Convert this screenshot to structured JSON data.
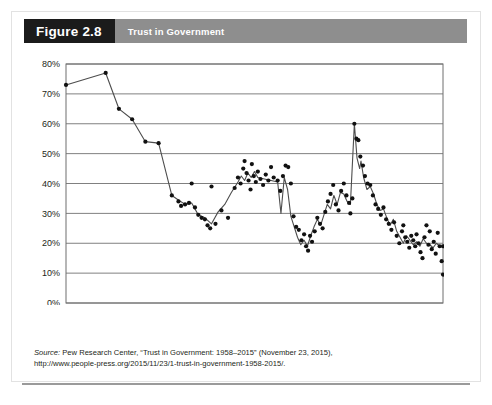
{
  "figure": {
    "badge_label": "Figure 2.8",
    "title": "Trust in Government"
  },
  "source": {
    "label": "Source:",
    "text": " Pew Research Center, “Trust in Government: 1958–2015” (November 23, 2015),",
    "url_line": "http://www.people-press.org/2015/11/23/1-trust-in-government-1958-2015/."
  },
  "colors": {
    "badge_background": "#1b1b1b",
    "title_background": "#8e8e8e",
    "gridline": "#808080",
    "plot_border": "#6f6f6f",
    "line": "#4d4d4d",
    "marker": "#111111",
    "bottom_rule": "#9a9a9a"
  },
  "chart_data": {
    "type": "line",
    "title": "Trust in Government",
    "xlabel": "",
    "ylabel": "",
    "xlim": [
      1958,
      2015
    ],
    "ylim": [
      0,
      80
    ],
    "grid": true,
    "legend": "none",
    "ytick_labels": [
      "0%",
      "10%",
      "20%",
      "30%",
      "40%",
      "50%",
      "60%",
      "70%",
      "80%"
    ],
    "ytick_values": [
      0,
      10,
      20,
      30,
      40,
      50,
      60,
      70,
      80
    ],
    "xtick_labels": [
      "1958",
      "1961",
      "1964",
      "1967",
      "1970",
      "1973",
      "1976",
      "1979",
      "1982",
      "1985",
      "1988",
      "1991",
      "1994",
      "1997",
      "2000",
      "2003",
      "2006",
      "2009",
      "2012",
      "2015"
    ],
    "xtick_values": [
      1958,
      1961,
      1964,
      1967,
      1970,
      1973,
      1976,
      1979,
      1982,
      1985,
      1988,
      1991,
      1994,
      1997,
      2000,
      2003,
      2006,
      2009,
      2012,
      2015
    ],
    "series": [
      {
        "name": "Trust in government (trend line)",
        "type": "line",
        "points": [
          [
            1958.0,
            73.0
          ],
          [
            1964.0,
            77.0
          ],
          [
            1966.0,
            65.0
          ],
          [
            1968.0,
            61.5
          ],
          [
            1970.0,
            54.0
          ],
          [
            1972.0,
            53.5
          ],
          [
            1974.0,
            36.0
          ],
          [
            1975.0,
            34.5
          ],
          [
            1976.0,
            33.0
          ],
          [
            1977.0,
            33.5
          ],
          [
            1978.0,
            29.5
          ],
          [
            1979.0,
            28.5
          ],
          [
            1980.0,
            26.5
          ],
          [
            1981.0,
            30.5
          ],
          [
            1982.0,
            33.0
          ],
          [
            1983.0,
            37.0
          ],
          [
            1984.0,
            40.5
          ],
          [
            1984.5,
            42.5
          ],
          [
            1985.0,
            41.0
          ],
          [
            1985.5,
            43.5
          ],
          [
            1986.0,
            42.0
          ],
          [
            1986.5,
            44.0
          ],
          [
            1987.0,
            42.0
          ],
          [
            1988.0,
            41.5
          ],
          [
            1989.0,
            41.0
          ],
          [
            1990.0,
            40.5
          ],
          [
            1990.5,
            30.0
          ],
          [
            1991.0,
            42.0
          ],
          [
            1991.5,
            38.0
          ],
          [
            1992.0,
            29.0
          ],
          [
            1993.0,
            22.0
          ],
          [
            1993.5,
            19.5
          ],
          [
            1994.0,
            21.0
          ],
          [
            1994.5,
            19.0
          ],
          [
            1995.0,
            22.5
          ],
          [
            1995.5,
            25.5
          ],
          [
            1996.0,
            28.0
          ],
          [
            1996.5,
            26.0
          ],
          [
            1997.0,
            29.5
          ],
          [
            1997.5,
            33.0
          ],
          [
            1998.0,
            31.5
          ],
          [
            1998.5,
            36.0
          ],
          [
            1999.0,
            33.0
          ],
          [
            1999.5,
            37.0
          ],
          [
            2000.0,
            36.5
          ],
          [
            2000.5,
            34.0
          ],
          [
            2001.0,
            33.0
          ],
          [
            2001.6,
            60.0
          ],
          [
            2002.0,
            48.5
          ],
          [
            2002.4,
            45.0
          ],
          [
            2002.6,
            47.5
          ],
          [
            2003.0,
            42.0
          ],
          [
            2003.5,
            38.0
          ],
          [
            2004.0,
            39.0
          ],
          [
            2004.5,
            36.5
          ],
          [
            2005.0,
            33.0
          ],
          [
            2005.5,
            31.0
          ],
          [
            2006.0,
            31.5
          ],
          [
            2006.5,
            28.5
          ],
          [
            2007.0,
            26.0
          ],
          [
            2007.5,
            28.0
          ],
          [
            2008.0,
            24.0
          ],
          [
            2008.5,
            22.0
          ],
          [
            2009.0,
            20.0
          ],
          [
            2009.5,
            22.5
          ],
          [
            2010.0,
            21.0
          ],
          [
            2010.5,
            19.5
          ],
          [
            2011.0,
            20.5
          ],
          [
            2011.5,
            19.0
          ],
          [
            2012.0,
            21.5
          ],
          [
            2012.5,
            20.0
          ],
          [
            2013.0,
            19.5
          ],
          [
            2013.5,
            18.5
          ],
          [
            2014.0,
            20.0
          ],
          [
            2014.5,
            19.0
          ],
          [
            2015.0,
            19.0
          ]
        ]
      },
      {
        "name": "Individual survey readings",
        "type": "scatter",
        "points": [
          [
            1958.0,
            73.0
          ],
          [
            1964.0,
            77.0
          ],
          [
            1966.0,
            65.0
          ],
          [
            1968.0,
            61.5
          ],
          [
            1970.0,
            54.0
          ],
          [
            1972.0,
            53.5
          ],
          [
            1974.0,
            36.0
          ],
          [
            1975.0,
            34.0
          ],
          [
            1975.4,
            32.5
          ],
          [
            1976.0,
            33.0
          ],
          [
            1976.6,
            33.5
          ],
          [
            1977.0,
            40.0
          ],
          [
            1977.5,
            32.0
          ],
          [
            1978.0,
            29.5
          ],
          [
            1978.5,
            28.5
          ],
          [
            1979.0,
            28.0
          ],
          [
            1979.4,
            26.0
          ],
          [
            1979.8,
            25.0
          ],
          [
            1980.0,
            39.0
          ],
          [
            1980.6,
            26.5
          ],
          [
            1981.5,
            31.0
          ],
          [
            1982.5,
            28.5
          ],
          [
            1983.5,
            38.5
          ],
          [
            1984.0,
            42.0
          ],
          [
            1984.4,
            40.0
          ],
          [
            1984.8,
            45.0
          ],
          [
            1985.0,
            47.5
          ],
          [
            1985.3,
            43.5
          ],
          [
            1985.6,
            41.0
          ],
          [
            1985.9,
            38.0
          ],
          [
            1986.1,
            46.5
          ],
          [
            1986.4,
            42.5
          ],
          [
            1986.7,
            40.5
          ],
          [
            1987.0,
            44.0
          ],
          [
            1987.4,
            41.5
          ],
          [
            1987.8,
            39.5
          ],
          [
            1988.2,
            43.0
          ],
          [
            1988.6,
            41.0
          ],
          [
            1989.0,
            45.5
          ],
          [
            1989.4,
            42.0
          ],
          [
            1990.0,
            41.0
          ],
          [
            1990.4,
            37.5
          ],
          [
            1990.8,
            42.5
          ],
          [
            1991.2,
            46.0
          ],
          [
            1991.6,
            45.5
          ],
          [
            1992.0,
            40.0
          ],
          [
            1992.4,
            29.0
          ],
          [
            1992.8,
            25.5
          ],
          [
            1993.2,
            24.5
          ],
          [
            1993.6,
            21.0
          ],
          [
            1994.0,
            23.0
          ],
          [
            1994.3,
            19.0
          ],
          [
            1994.6,
            17.5
          ],
          [
            1994.9,
            22.5
          ],
          [
            1995.2,
            20.5
          ],
          [
            1995.6,
            24.0
          ],
          [
            1996.0,
            28.5
          ],
          [
            1996.4,
            26.5
          ],
          [
            1996.8,
            25.0
          ],
          [
            1997.2,
            30.5
          ],
          [
            1997.6,
            34.0
          ],
          [
            1998.0,
            36.5
          ],
          [
            1998.4,
            39.5
          ],
          [
            1998.8,
            33.0
          ],
          [
            1999.2,
            31.0
          ],
          [
            1999.6,
            37.5
          ],
          [
            2000.0,
            40.0
          ],
          [
            2000.4,
            36.0
          ],
          [
            2000.8,
            33.5
          ],
          [
            2001.0,
            30.0
          ],
          [
            2001.3,
            35.0
          ],
          [
            2001.6,
            60.0
          ],
          [
            2001.9,
            55.0
          ],
          [
            2002.2,
            54.5
          ],
          [
            2002.5,
            49.0
          ],
          [
            2002.9,
            46.0
          ],
          [
            2003.2,
            42.5
          ],
          [
            2003.6,
            40.0
          ],
          [
            2004.0,
            39.5
          ],
          [
            2004.4,
            36.0
          ],
          [
            2004.8,
            33.0
          ],
          [
            2005.2,
            31.5
          ],
          [
            2005.6,
            29.5
          ],
          [
            2006.0,
            32.0
          ],
          [
            2006.4,
            28.0
          ],
          [
            2006.8,
            26.5
          ],
          [
            2007.2,
            24.5
          ],
          [
            2007.6,
            27.0
          ],
          [
            2008.0,
            22.5
          ],
          [
            2008.4,
            20.0
          ],
          [
            2008.8,
            24.0
          ],
          [
            2009.0,
            26.0
          ],
          [
            2009.3,
            22.0
          ],
          [
            2009.6,
            20.5
          ],
          [
            2009.9,
            18.5
          ],
          [
            2010.2,
            22.5
          ],
          [
            2010.5,
            21.0
          ],
          [
            2010.8,
            19.0
          ],
          [
            2011.0,
            23.0
          ],
          [
            2011.3,
            20.0
          ],
          [
            2011.6,
            17.0
          ],
          [
            2011.9,
            15.0
          ],
          [
            2012.2,
            22.0
          ],
          [
            2012.5,
            26.0
          ],
          [
            2012.8,
            19.5
          ],
          [
            2013.0,
            24.0
          ],
          [
            2013.3,
            18.0
          ],
          [
            2013.6,
            20.5
          ],
          [
            2013.9,
            16.5
          ],
          [
            2014.2,
            23.5
          ],
          [
            2014.5,
            19.0
          ],
          [
            2014.8,
            14.0
          ],
          [
            2015.0,
            19.0
          ],
          [
            2015.0,
            9.5
          ]
        ]
      }
    ]
  }
}
